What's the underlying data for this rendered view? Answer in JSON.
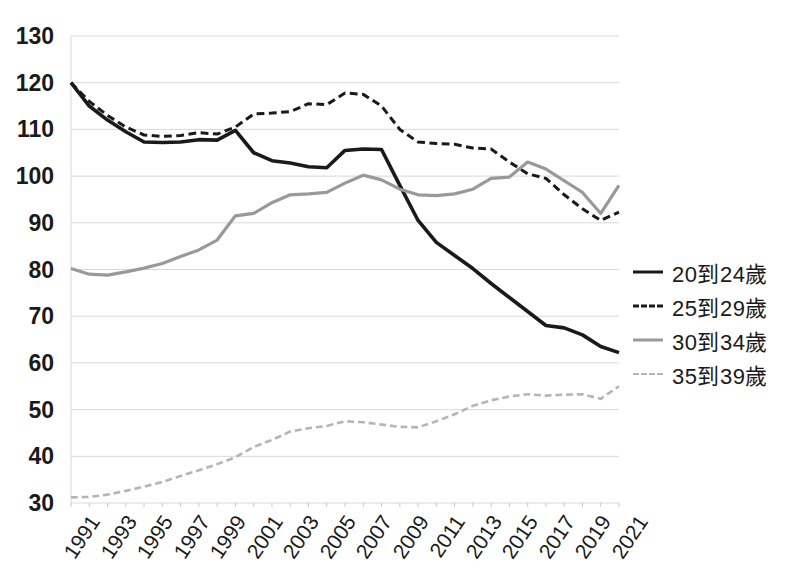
{
  "chart_data": {
    "type": "line",
    "title": "",
    "subtitle": "",
    "xlabel": "",
    "ylabel": "",
    "xlim": [
      1991,
      2021
    ],
    "ylim": [
      30,
      130
    ],
    "ytick_step": 10,
    "xtick_step": 2,
    "grid": true,
    "grid_color": "#d9d9d9",
    "legend_position": "right",
    "x": [
      1991,
      1992,
      1993,
      1994,
      1995,
      1996,
      1997,
      1998,
      1999,
      2000,
      2001,
      2002,
      2003,
      2004,
      2005,
      2006,
      2007,
      2008,
      2009,
      2010,
      2011,
      2012,
      2013,
      2014,
      2015,
      2016,
      2017,
      2018,
      2019,
      2020,
      2021
    ],
    "ytick_labels": [
      "130",
      "120",
      "110",
      "100",
      "90",
      "80",
      "70",
      "60",
      "50",
      "40",
      "30"
    ],
    "ytick_values": [
      130,
      120,
      110,
      100,
      90,
      80,
      70,
      60,
      50,
      40,
      30
    ],
    "xtick_labels": [
      "1991",
      "1993",
      "1995",
      "1997",
      "1999",
      "2001",
      "2003",
      "2005",
      "2007",
      "2009",
      "2011",
      "2013",
      "2015",
      "2017",
      "2019",
      "2021"
    ],
    "xtick_values": [
      1991,
      1993,
      1995,
      1997,
      1999,
      2001,
      2003,
      2005,
      2007,
      2009,
      2011,
      2013,
      2015,
      2017,
      2019,
      2021
    ],
    "series": [
      {
        "name": "20到24歲",
        "color": "#1a1a1a",
        "dash": "solid",
        "width": 3.6,
        "values": [
          120.0,
          115.0,
          112.0,
          109.5,
          107.3,
          107.2,
          107.3,
          107.8,
          107.7,
          109.8,
          105.0,
          103.3,
          102.8,
          102.0,
          101.8,
          105.5,
          105.8,
          105.7,
          98.0,
          90.5,
          85.8,
          83.0,
          80.2,
          77.0,
          74.0,
          71.0,
          68.0,
          67.5,
          66.0,
          63.5,
          62.2
        ]
      },
      {
        "name": "25到29歲",
        "color": "#1a1a1a",
        "dash": "dashed",
        "width": 3.0,
        "values": [
          120.0,
          116.0,
          113.0,
          110.5,
          108.8,
          108.5,
          108.7,
          109.3,
          109.0,
          110.5,
          113.3,
          113.5,
          113.8,
          115.5,
          115.3,
          117.8,
          117.5,
          115.0,
          110.0,
          107.3,
          107.0,
          106.8,
          106.0,
          105.8,
          103.0,
          100.5,
          99.5,
          96.0,
          93.0,
          90.5,
          92.3
        ]
      },
      {
        "name": "30到34歲",
        "color": "#999999",
        "dash": "solid",
        "width": 3.2,
        "values": [
          80.2,
          79.0,
          78.8,
          79.5,
          80.3,
          81.3,
          82.8,
          84.2,
          86.3,
          91.5,
          92.0,
          94.3,
          96.0,
          96.2,
          96.5,
          98.5,
          100.2,
          99.2,
          97.2,
          96.0,
          95.8,
          96.2,
          97.2,
          99.5,
          99.8,
          103.0,
          101.5,
          99.0,
          96.5,
          92.0,
          98.0
        ]
      },
      {
        "name": "35到39歲",
        "color": "#b5b5b5",
        "dash": "dashed",
        "width": 2.6,
        "values": [
          31.2,
          31.3,
          31.8,
          32.6,
          33.5,
          34.5,
          35.8,
          37.0,
          38.3,
          39.8,
          42.0,
          43.5,
          45.3,
          46.0,
          46.5,
          47.5,
          47.3,
          46.8,
          46.3,
          46.2,
          47.5,
          49.0,
          50.8,
          52.0,
          52.8,
          53.3,
          53.0,
          53.2,
          53.3,
          52.3,
          55.0
        ]
      }
    ]
  },
  "legend": {
    "items": [
      {
        "label": "20到24歲",
        "swatch": "solid-dark-line-icon"
      },
      {
        "label": "25到29歲",
        "swatch": "dashed-dark-line-icon"
      },
      {
        "label": "30到34歲",
        "swatch": "solid-gray-line-icon"
      },
      {
        "label": "35到39歲",
        "swatch": "dashed-light-gray-line-icon"
      }
    ]
  }
}
